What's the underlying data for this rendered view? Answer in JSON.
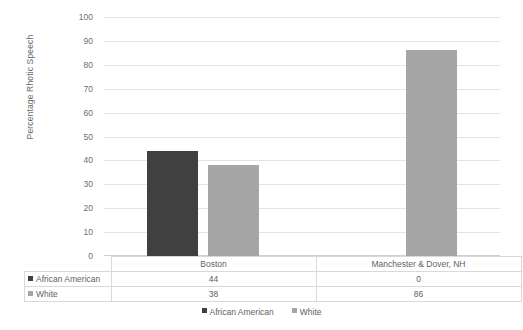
{
  "chart_data": {
    "type": "bar",
    "title": "",
    "xlabel": "",
    "ylabel": "Percentage Rhotic Speech",
    "ylim": [
      0,
      100
    ],
    "ytick_step": 10,
    "yticks": [
      "100",
      "90",
      "80",
      "70",
      "60",
      "50",
      "40",
      "30",
      "20",
      "10",
      "0"
    ],
    "grid": true,
    "legend_position": "bottom",
    "categories": [
      "Boston",
      "Manchester & Dover, NH"
    ],
    "series": [
      {
        "name": "African American",
        "values": [
          44,
          0
        ],
        "color": "#404040"
      },
      {
        "name": "White",
        "values": [
          38,
          86
        ],
        "color": "#a6a6a6"
      }
    ],
    "data_table": {
      "header": [
        "",
        "Boston",
        "Manchester & Dover, NH"
      ],
      "rows": [
        {
          "label": "African American",
          "swatch": "dark-square-icon",
          "values": [
            "44",
            "0"
          ]
        },
        {
          "label": "White",
          "swatch": "gray-square-icon",
          "values": [
            "38",
            "86"
          ]
        }
      ]
    },
    "legend": [
      {
        "label": "African American",
        "color": "#404040"
      },
      {
        "label": "White",
        "color": "#a6a6a6"
      }
    ]
  },
  "colors": {
    "african_american": "#404040",
    "white": "#a6a6a6",
    "gridline": "#e4e4e4",
    "text": "#5f5f5f",
    "background": "#ffffff"
  }
}
